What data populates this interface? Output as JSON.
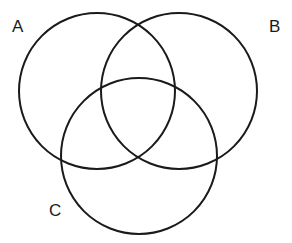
{
  "figure": {
    "type": "venn-diagram",
    "width": 292,
    "height": 243,
    "background_color": "#ffffff",
    "stroke_color": "#1a1a1a",
    "stroke_width": 2,
    "fill": "none"
  },
  "chart_data": {
    "type": "diagram",
    "subtype": "venn",
    "title": "",
    "sets": [
      {
        "id": "A",
        "label": "A",
        "cx": 97,
        "cy": 91,
        "r": 78,
        "label_x": 19,
        "label_y": 26
      },
      {
        "id": "B",
        "label": "B",
        "cx": 179,
        "cy": 91,
        "r": 78,
        "label_x": 276,
        "label_y": 26
      },
      {
        "id": "C",
        "label": "C",
        "cx": 139,
        "cy": 156,
        "r": 78,
        "label_x": 56,
        "label_y": 210
      }
    ],
    "regions": [
      "A",
      "B",
      "C",
      "A∩B",
      "A∩C",
      "B∩C",
      "A∩B∩C"
    ],
    "region_values": [],
    "grid": false,
    "legend": "none"
  },
  "labels": {
    "a": "A",
    "b": "B",
    "c": "C"
  }
}
